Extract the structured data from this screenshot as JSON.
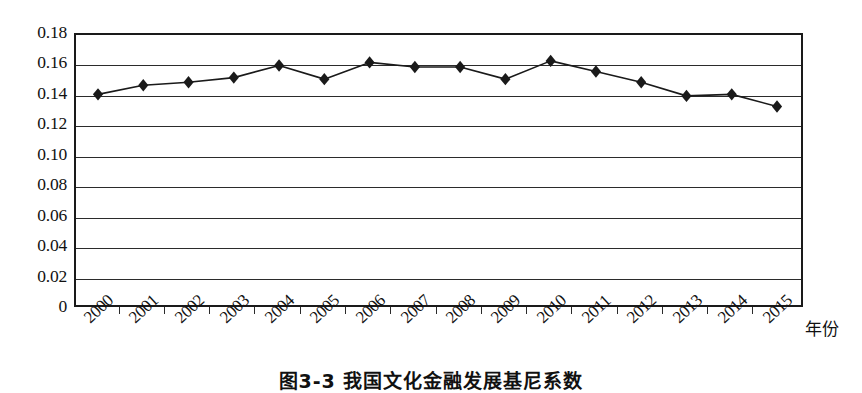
{
  "figure": {
    "caption": "图3-3 我国文化金融发展基尼系数"
  },
  "chart_data": {
    "type": "line",
    "title": "",
    "subtitle": "",
    "xlabel": "年份",
    "ylabel": "",
    "categories": [
      "2000",
      "2001",
      "2002",
      "2003",
      "2004",
      "2005",
      "2006",
      "2007",
      "2008",
      "2009",
      "2010",
      "2011",
      "2012",
      "2013",
      "2014",
      "2015"
    ],
    "values": [
      0.141,
      0.147,
      0.149,
      0.152,
      0.16,
      0.151,
      0.162,
      0.159,
      0.159,
      0.151,
      0.163,
      0.156,
      0.149,
      0.14,
      0.141,
      0.133
    ],
    "series": [
      {
        "name": "基尼系数",
        "values": [
          0.141,
          0.147,
          0.149,
          0.152,
          0.16,
          0.151,
          0.162,
          0.159,
          0.159,
          0.151,
          0.163,
          0.156,
          0.149,
          0.14,
          0.141,
          0.133
        ]
      }
    ],
    "ylim": [
      0,
      0.18
    ],
    "ytick_labels": [
      "0.18",
      "0.16",
      "0.14",
      "0.12",
      "0.10",
      "0.08",
      "0.06",
      "0.04",
      "0.02",
      "0"
    ],
    "ytick_values": [
      0.18,
      0.16,
      0.14,
      0.12,
      0.1,
      0.08,
      0.06,
      0.04,
      0.02,
      0
    ],
    "grid": true,
    "grid_axis": "y",
    "legend": false,
    "legend_position": "none",
    "marker": "diamond",
    "line_color": "#1a1a1a",
    "marker_color": "#1a1a1a",
    "background_color": "#ffffff",
    "annotations": []
  }
}
